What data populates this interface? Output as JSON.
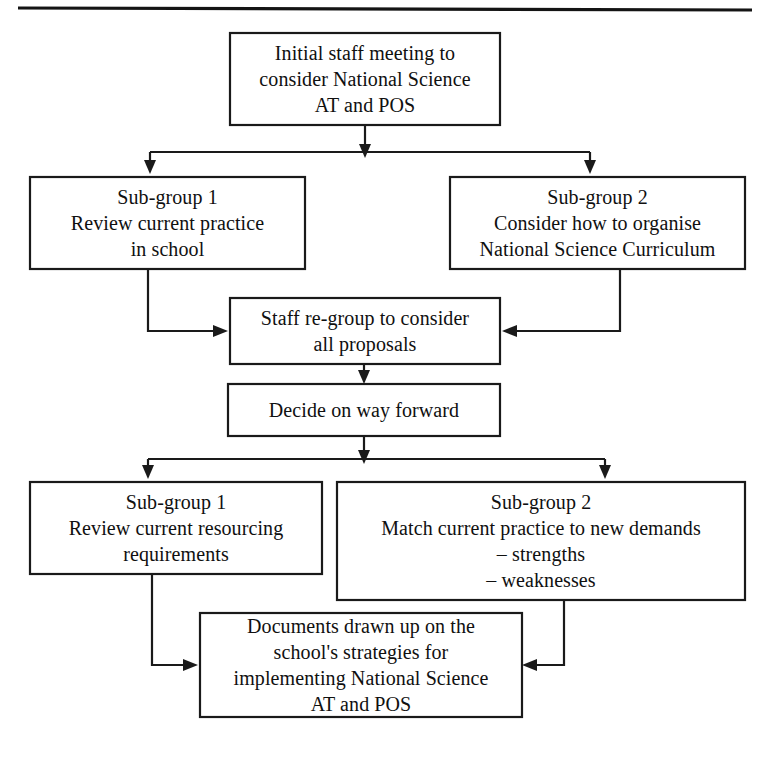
{
  "page": {
    "width": 770,
    "height": 771,
    "background_color": "#ffffff",
    "line_color": "#1a1a1a",
    "text_color": "#101010",
    "top_rule": "horizontal-rule"
  },
  "diagram": {
    "type": "flowchart",
    "orientation": "top-to-bottom",
    "nodes": [
      {
        "id": "initial-staff-meeting",
        "name": "initial-staff-meeting-box",
        "lines": [
          "Initial staff meeting to",
          "consider National Science",
          "AT and POS"
        ],
        "x": 230,
        "y": 33,
        "width": 270,
        "height": 92
      },
      {
        "id": "sub-group-1-review-practice",
        "name": "sub-group-1-review-practice-box",
        "lines": [
          "Sub-group 1",
          "Review current practice",
          "in school"
        ],
        "x": 30,
        "y": 177,
        "width": 275,
        "height": 92
      },
      {
        "id": "sub-group-2-organise-curriculum",
        "name": "sub-group-2-organise-curriculum-box",
        "lines": [
          "Sub-group 2",
          "Consider how to organise",
          "National Science Curriculum"
        ],
        "x": 450,
        "y": 177,
        "width": 295,
        "height": 92
      },
      {
        "id": "staff-re-group",
        "name": "staff-re-group-box",
        "lines": [
          "Staff re-group to consider",
          "all proposals"
        ],
        "x": 230,
        "y": 298,
        "width": 270,
        "height": 66
      },
      {
        "id": "decide-on-way-forward",
        "name": "decide-on-way-forward-box",
        "lines": [
          "Decide on way forward"
        ],
        "x": 228,
        "y": 384,
        "width": 272,
        "height": 52
      },
      {
        "id": "sub-group-1-resourcing",
        "name": "sub-group-1-resourcing-box",
        "lines": [
          "Sub-group 1",
          "Review current resourcing",
          "requirements"
        ],
        "x": 30,
        "y": 482,
        "width": 292,
        "height": 92
      },
      {
        "id": "sub-group-2-match-practice",
        "name": "sub-group-2-match-practice-box",
        "lines": [
          "Sub-group 2",
          "Match current practice to new demands",
          "– strengths",
          "– weaknesses"
        ],
        "x": 337,
        "y": 482,
        "width": 408,
        "height": 118
      },
      {
        "id": "documents-drawn-up",
        "name": "documents-drawn-up-box",
        "lines": [
          "Documents drawn up on the",
          "school's strategies for",
          "implementing National Science",
          "AT and POS"
        ],
        "x": 200,
        "y": 613,
        "width": 322,
        "height": 104
      }
    ],
    "connectors": [
      {
        "id": "meeting-to-split",
        "name": "connector-meeting-to-branch",
        "from": "initial-staff-meeting",
        "to": "branch-point-1"
      },
      {
        "id": "branch-to-subgroup1",
        "name": "connector-branch-to-sub-group-1",
        "from": "branch-point-1",
        "to": "sub-group-1-review-practice"
      },
      {
        "id": "branch-to-subgroup2",
        "name": "connector-branch-to-sub-group-2",
        "from": "branch-point-1",
        "to": "sub-group-2-organise-curriculum"
      },
      {
        "id": "subgroup1-to-regroup",
        "name": "connector-sub-group-1-to-staff-re-group",
        "from": "sub-group-1-review-practice",
        "to": "staff-re-group"
      },
      {
        "id": "subgroup2-to-regroup",
        "name": "connector-sub-group-2-to-staff-re-group",
        "from": "sub-group-2-organise-curriculum",
        "to": "staff-re-group"
      },
      {
        "id": "regroup-to-decide",
        "name": "connector-staff-re-group-to-decide",
        "from": "staff-re-group",
        "to": "decide-on-way-forward"
      },
      {
        "id": "decide-to-split",
        "name": "connector-decide-to-branch",
        "from": "decide-on-way-forward",
        "to": "branch-point-2"
      },
      {
        "id": "branch2-to-subgroup1",
        "name": "connector-branch-to-sub-group-1-resourcing",
        "from": "branch-point-2",
        "to": "sub-group-1-resourcing"
      },
      {
        "id": "branch2-to-subgroup2",
        "name": "connector-branch-to-sub-group-2-match",
        "from": "branch-point-2",
        "to": "sub-group-2-match-practice"
      },
      {
        "id": "resourcing-to-documents",
        "name": "connector-resourcing-to-documents",
        "from": "sub-group-1-resourcing",
        "to": "documents-drawn-up"
      },
      {
        "id": "match-to-documents",
        "name": "connector-match-to-documents",
        "from": "sub-group-2-match-practice",
        "to": "documents-drawn-up"
      }
    ]
  }
}
